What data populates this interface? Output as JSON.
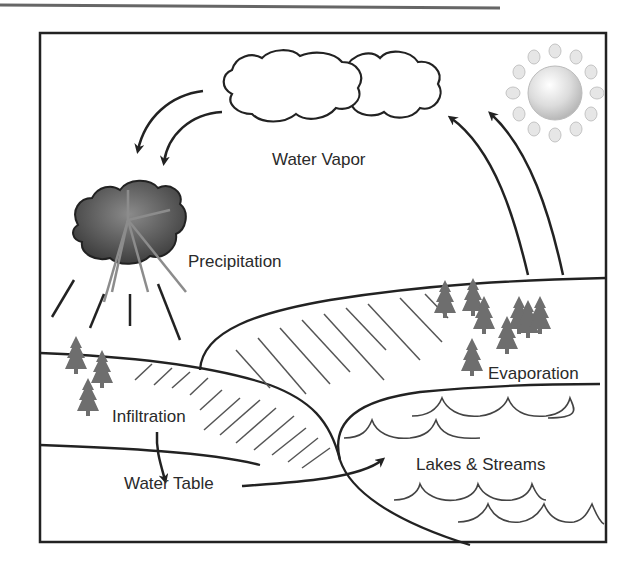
{
  "diagram": {
    "colors": {
      "line": "#222222",
      "hatch": "#555555",
      "tree": "#6e6e6e",
      "storm_cloud": "#555555",
      "sun": "#d8d8d8",
      "header_rule": "#666666"
    },
    "labels": {
      "water_vapor": "Water Vapor",
      "precipitation": "Precipitation",
      "evaporation": "Evaporation",
      "infiltration": "Infiltration",
      "lakes_streams": "Lakes & Streams",
      "water_table": "Water Table"
    },
    "elements": [
      {
        "id": "vapor-clouds",
        "icon": "cloud-icon",
        "count": 2
      },
      {
        "id": "sun",
        "icon": "sun-icon"
      },
      {
        "id": "storm-cloud",
        "icon": "rain-cloud-icon"
      },
      {
        "id": "trees",
        "icon": "pine-tree-icon",
        "count": 10
      },
      {
        "id": "waves",
        "icon": "wave-icon",
        "rows": 4
      }
    ],
    "flows": [
      {
        "from": "Water Vapor",
        "to": "Precipitation",
        "arrows": 2
      },
      {
        "from": "Evaporation",
        "to": "Water Vapor",
        "arrows": 2
      },
      {
        "from": "Infiltration",
        "to": "Water Table",
        "arrows": 1
      },
      {
        "from": "Water Table",
        "to": "Lakes & Streams",
        "arrows": 1
      }
    ]
  }
}
